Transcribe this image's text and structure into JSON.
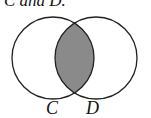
{
  "caption": "C and D.",
  "diagram": {
    "type": "venn",
    "sets": [
      {
        "label": "C",
        "cx": 53,
        "cy": 58,
        "r": 41
      },
      {
        "label": "D",
        "cx": 96,
        "cy": 58,
        "r": 41
      }
    ],
    "shaded_region": "C ∩ D",
    "shade_color": "#8a8a8a",
    "stroke_color": "#222222"
  }
}
